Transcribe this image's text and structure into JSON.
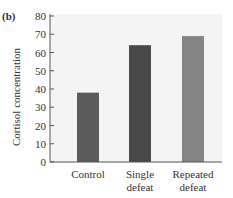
{
  "chart_data": {
    "type": "bar",
    "panel_label": "(b)",
    "title": "",
    "xlabel": "",
    "ylabel": "Cortisol concentration",
    "categories": [
      [
        "Control"
      ],
      [
        "Single",
        "defeat"
      ],
      [
        "Repeated",
        "defeat"
      ]
    ],
    "values": [
      38,
      64,
      69
    ],
    "bar_colors": [
      "#5a5a5a",
      "#484848",
      "#858585"
    ],
    "ylim": [
      0,
      80
    ],
    "yticks": [
      0,
      10,
      20,
      30,
      40,
      50,
      60,
      70,
      80
    ],
    "grid": false,
    "plot_background": "#f4f4f4"
  }
}
